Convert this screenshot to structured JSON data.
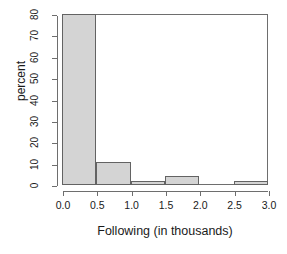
{
  "chart_data": {
    "type": "bar",
    "title": "",
    "subtitle": "",
    "xlabel": "Following (in thousands)",
    "ylabel": "percent",
    "bin_width": 0.5,
    "bin_edges": [
      0.0,
      0.5,
      1.0,
      1.5,
      2.0,
      2.5,
      3.0
    ],
    "categories": [
      "0.0-0.5",
      "0.5-1.0",
      "1.0-1.5",
      "1.5-2.0",
      "2.0-2.5",
      "2.5-3.0"
    ],
    "values": [
      80,
      11,
      2,
      4,
      0,
      2
    ],
    "xlim": [
      0.0,
      3.0
    ],
    "ylim": [
      0,
      80
    ],
    "xticks": [
      0.0,
      0.5,
      1.0,
      1.5,
      2.0,
      2.5,
      3.0
    ],
    "xtick_labels": [
      "0.0",
      "0.5",
      "1.0",
      "1.5",
      "2.0",
      "2.5",
      "3.0"
    ],
    "yticks": [
      0,
      10,
      20,
      30,
      40,
      50,
      60,
      70,
      80
    ],
    "ytick_labels": [
      "0",
      "10",
      "20",
      "30",
      "40",
      "50",
      "60",
      "70",
      "80"
    ],
    "grid": false,
    "legend": false,
    "legend_position": "none",
    "bar_fill_color": "#d4d4d4",
    "bar_border_color": "#636363",
    "axis_color": "#6e6e6e",
    "text_color": "#1a1a1a",
    "background_color": "#ffffff"
  }
}
